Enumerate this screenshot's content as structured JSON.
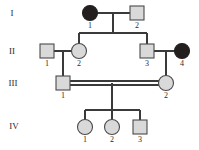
{
  "figure": {
    "type": "pedigree-chart",
    "width": 199,
    "height": 150,
    "background_color": "#ffffff",
    "line_color": "#3a3a3a",
    "unaffected_fill": "#d9d9d9",
    "affected_fill": "#241f1f",
    "symbol_stroke": "#4a4a4a"
  },
  "generation_labels": [
    {
      "id": "gen-label-1",
      "text": "I",
      "x": 12,
      "y": 14
    },
    {
      "id": "gen-label-2",
      "text": "II",
      "x": 12,
      "y": 52
    },
    {
      "id": "gen-label-3",
      "text": "III",
      "x": 13,
      "y": 84
    },
    {
      "id": "gen-label-4",
      "text": "IV",
      "x": 14,
      "y": 127
    }
  ],
  "individuals": [
    {
      "id": "I-1",
      "generation": "I",
      "number": "1",
      "sex": "female",
      "shape": "circle",
      "affected": true,
      "cx": 90,
      "cy": 13,
      "r": 7.5,
      "label_x": 90,
      "label_y": 21
    },
    {
      "id": "I-2",
      "generation": "I",
      "number": "2",
      "sex": "male",
      "shape": "square",
      "affected": false,
      "cx": 137,
      "cy": 13,
      "size": 14,
      "label_x": 137,
      "label_y": 21
    },
    {
      "id": "II-1",
      "generation": "II",
      "number": "1",
      "sex": "male",
      "shape": "square",
      "affected": false,
      "cx": 47,
      "cy": 51,
      "size": 14,
      "label_x": 47,
      "label_y": 59
    },
    {
      "id": "II-2",
      "generation": "II",
      "number": "2",
      "sex": "female",
      "shape": "circle",
      "affected": false,
      "cx": 79,
      "cy": 51,
      "r": 7.5,
      "label_x": 79,
      "label_y": 59
    },
    {
      "id": "II-3",
      "generation": "II",
      "number": "3",
      "sex": "male",
      "shape": "square",
      "affected": false,
      "cx": 147,
      "cy": 51,
      "size": 14,
      "label_x": 147,
      "label_y": 59
    },
    {
      "id": "II-4",
      "generation": "II",
      "number": "4",
      "sex": "female",
      "shape": "circle",
      "affected": true,
      "cx": 182,
      "cy": 51,
      "r": 7.5,
      "label_x": 182,
      "label_y": 59
    },
    {
      "id": "III-1",
      "generation": "III",
      "number": "1",
      "sex": "male",
      "shape": "square",
      "affected": false,
      "cx": 63,
      "cy": 83,
      "size": 14,
      "label_x": 63,
      "label_y": 91
    },
    {
      "id": "III-2",
      "generation": "III",
      "number": "2",
      "sex": "female",
      "shape": "circle",
      "affected": false,
      "cx": 166,
      "cy": 83,
      "r": 7.5,
      "label_x": 166,
      "label_y": 91
    },
    {
      "id": "IV-1",
      "generation": "IV",
      "number": "1",
      "sex": "female",
      "shape": "circle",
      "affected": false,
      "cx": 85,
      "cy": 127,
      "r": 7.5,
      "label_x": 85,
      "label_y": 135
    },
    {
      "id": "IV-2",
      "generation": "IV",
      "number": "2",
      "sex": "female",
      "shape": "circle",
      "affected": false,
      "cx": 112,
      "cy": 127,
      "r": 7.5,
      "label_x": 112,
      "label_y": 135
    },
    {
      "id": "IV-3",
      "generation": "IV",
      "number": "3",
      "sex": "male",
      "shape": "square",
      "affected": false,
      "cx": 140,
      "cy": 127,
      "size": 14,
      "label_x": 140,
      "label_y": 135
    }
  ],
  "matings": [
    {
      "id": "mating-I1-I2",
      "partners": [
        "I-1",
        "I-2"
      ],
      "consanguineous": false,
      "line": {
        "x1": 98,
        "y1": 13,
        "x2": 130,
        "y2": 13
      }
    },
    {
      "id": "mating-II1-II2",
      "partners": [
        "II-1",
        "II-2"
      ],
      "consanguineous": false,
      "line": {
        "x1": 54,
        "y1": 51,
        "x2": 72,
        "y2": 51
      }
    },
    {
      "id": "mating-II3-II4",
      "partners": [
        "II-3",
        "II-4"
      ],
      "consanguineous": false,
      "line": {
        "x1": 154,
        "y1": 51,
        "x2": 175,
        "y2": 51
      }
    },
    {
      "id": "mating-III1-III2",
      "partners": [
        "III-1",
        "III-2"
      ],
      "consanguineous": true,
      "line": {
        "x1": 70,
        "y1": 83,
        "x2": 159,
        "y2": 83
      },
      "double_offset": 2
    }
  ],
  "sibships": [
    {
      "id": "sibship-gen2",
      "parents": "mating-I1-I2",
      "children": [
        "II-2",
        "II-3"
      ],
      "descent_x": 113,
      "descent_y1": 13,
      "descent_y2": 33,
      "bar_y": 33,
      "bar_x1": 79,
      "bar_x2": 147
    },
    {
      "id": "sibship-gen3-left",
      "parents": "mating-II1-II2",
      "children": [
        "III-1"
      ],
      "descent_x": 63,
      "descent_y1": 51,
      "descent_y2": 76
    },
    {
      "id": "sibship-gen3-right",
      "parents": "mating-II3-II4",
      "children": [
        "III-2"
      ],
      "descent_x": 166,
      "descent_y1": 51,
      "descent_y2": 75.5
    },
    {
      "id": "sibship-gen4",
      "parents": "mating-III1-III2",
      "children": [
        "IV-1",
        "IV-2",
        "IV-3"
      ],
      "descent_x": 112,
      "descent_y1": 83,
      "descent_y2": 110,
      "bar_y": 110,
      "bar_x1": 85,
      "bar_x2": 140
    }
  ],
  "child_stems": [
    {
      "id": "stem-IV-1",
      "x": 85,
      "y1": 110,
      "y2": 119.5
    },
    {
      "id": "stem-IV-2",
      "x": 112,
      "y1": 110,
      "y2": 119.5
    },
    {
      "id": "stem-IV-3",
      "x": 140,
      "y1": 110,
      "y2": 120
    },
    {
      "id": "stem-II-2",
      "x": 79,
      "y1": 33,
      "y2": 43.5
    },
    {
      "id": "stem-II-3",
      "x": 147,
      "y1": 33,
      "y2": 44
    }
  ]
}
